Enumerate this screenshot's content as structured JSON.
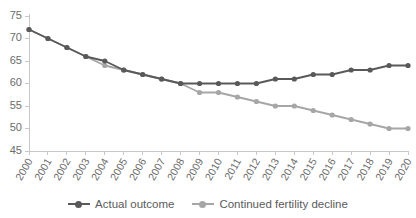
{
  "chart_data": {
    "type": "line",
    "title": "",
    "subtitle": "",
    "xlabel": "",
    "ylabel": "",
    "x": [
      "2000",
      "2001",
      "2002",
      "2003",
      "2004",
      "2005",
      "2006",
      "2007",
      "2008",
      "2009",
      "2010",
      "2011",
      "2012",
      "2013",
      "2014",
      "2015",
      "2016",
      "2017",
      "2018",
      "2019",
      "2020"
    ],
    "categories": [
      "2000",
      "2001",
      "2002",
      "2003",
      "2004",
      "2005",
      "2006",
      "2007",
      "2008",
      "2009",
      "2010",
      "2011",
      "2012",
      "2013",
      "2014",
      "2015",
      "2016",
      "2017",
      "2018",
      "2019",
      "2020"
    ],
    "series": [
      {
        "name": "Actual outcome",
        "color": "#595959",
        "marker": "circle",
        "values": [
          72,
          70,
          68,
          66,
          65,
          63,
          62,
          61,
          60,
          60,
          60,
          60,
          60,
          61,
          61,
          62,
          62,
          63,
          63,
          64,
          64
        ]
      },
      {
        "name": "Continued fertility decline",
        "color": "#a6a6a6",
        "marker": "circle",
        "values": [
          72,
          70,
          68,
          66,
          64,
          63,
          62,
          61,
          60,
          58,
          58,
          57,
          56,
          55,
          55,
          54,
          53,
          52,
          51,
          50,
          50
        ]
      }
    ],
    "ylim": [
      45,
      75
    ],
    "ytick_values": [
      45,
      50,
      55,
      60,
      65,
      70,
      75
    ],
    "ytick_labels": [
      "45",
      "50",
      "55",
      "60",
      "65",
      "70",
      "75"
    ],
    "grid": false,
    "legend_position": "bottom",
    "axis_color": "#c8c8c8",
    "tick_label_color": "#6b6b6b"
  },
  "legend": {
    "items": [
      {
        "label": "Actual outcome",
        "color": "#595959"
      },
      {
        "label": "Continued fertility decline",
        "color": "#a6a6a6"
      }
    ]
  }
}
